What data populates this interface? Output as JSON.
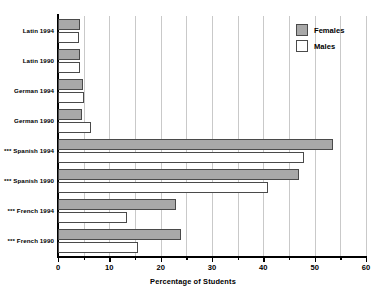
{
  "chart_data": {
    "type": "bar",
    "orientation": "horizontal",
    "title": "",
    "xlabel": "Percentage of Students",
    "ylabel": "",
    "xlim": [
      0,
      60
    ],
    "xticks": [
      0,
      10,
      20,
      30,
      40,
      50,
      60
    ],
    "xtick_labels": [
      "0",
      "10",
      "20",
      "30",
      "40",
      "50",
      "60"
    ],
    "minor_tick_step": 5,
    "grid": "vertical gridlines every 5 units",
    "legend_position": "upper right",
    "categories": [
      "Latin 1994",
      "Latin 1990",
      "German 1994",
      "German 1990",
      "*** Spanish 1994",
      "*** Spanish 1990",
      "*** French 1994",
      "*** French 1990"
    ],
    "series": [
      {
        "name": "Females",
        "color": "#a8a8a8",
        "values": [
          4.2,
          4.2,
          4.8,
          4.6,
          53.5,
          47.0,
          23.0,
          24.0
        ]
      },
      {
        "name": "Males",
        "color": "#ffffff",
        "values": [
          4.0,
          4.2,
          5.0,
          6.5,
          48.0,
          41.0,
          13.5,
          15.5
        ]
      }
    ],
    "legend": [
      "Females",
      "Males"
    ],
    "note_marker": "***"
  },
  "axis": {
    "x_title": "Percentage of Students"
  },
  "legend": {
    "items": [
      {
        "label": "Females",
        "swatch": "female"
      },
      {
        "label": "Males",
        "swatch": "male"
      }
    ]
  }
}
